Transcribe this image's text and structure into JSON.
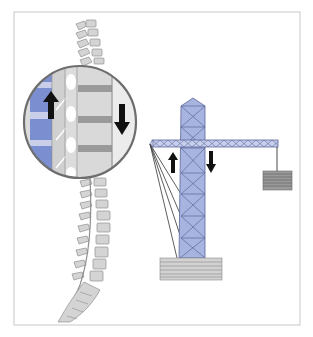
{
  "figure": {
    "width": 313,
    "height": 337,
    "background": "#ffffff",
    "frame": {
      "x": 14,
      "y": 12,
      "width": 286,
      "height": 313,
      "stroke": "#c8c8c8"
    },
    "caption": ""
  },
  "colors": {
    "bone_fill": "#d4d4d4",
    "bone_stroke": "#8f8f8f",
    "disc_fill": "#9a9a9a",
    "muscle_blue": "#7b8fd0",
    "muscle_light": "#c9cfe8",
    "tower_fill": "#a8b4e0",
    "tower_stroke": "#5a6699",
    "jib_fill": "#c7cfec",
    "base_fill": "#d2d2d2",
    "base_lines": "#8a8a8a",
    "weight_fill": "#9a9a9a",
    "weight_lines": "#5a5a5a",
    "cable": "#444444",
    "arrow": "#111111",
    "circle_stroke": "#6e6e6e"
  },
  "spine": {
    "label": "spinal column",
    "magnifier": {
      "cx": 80,
      "cy": 122,
      "r": 57,
      "label": "magnified vertebral segment"
    },
    "arrows": [
      {
        "name": "muscle-pull-up-arrow",
        "direction": "up",
        "x": 50,
        "y": 95
      },
      {
        "name": "load-down-arrow",
        "direction": "down",
        "x": 121,
        "y": 106
      }
    ]
  },
  "crane": {
    "label": "tower crane",
    "tower": {
      "x": 181,
      "y": 98,
      "width": 24,
      "height": 160
    },
    "jib": {
      "x": 150,
      "y": 140,
      "width": 128,
      "height": 7
    },
    "weight": {
      "x": 263,
      "y": 172,
      "width": 29,
      "height": 18
    },
    "base": {
      "x": 160,
      "y": 258,
      "width": 62,
      "height": 22
    },
    "arrows": [
      {
        "name": "counter-force-up-arrow",
        "direction": "up",
        "x": 172,
        "y": 152
      },
      {
        "name": "load-down-arrow",
        "direction": "down",
        "x": 211,
        "y": 152
      }
    ]
  }
}
